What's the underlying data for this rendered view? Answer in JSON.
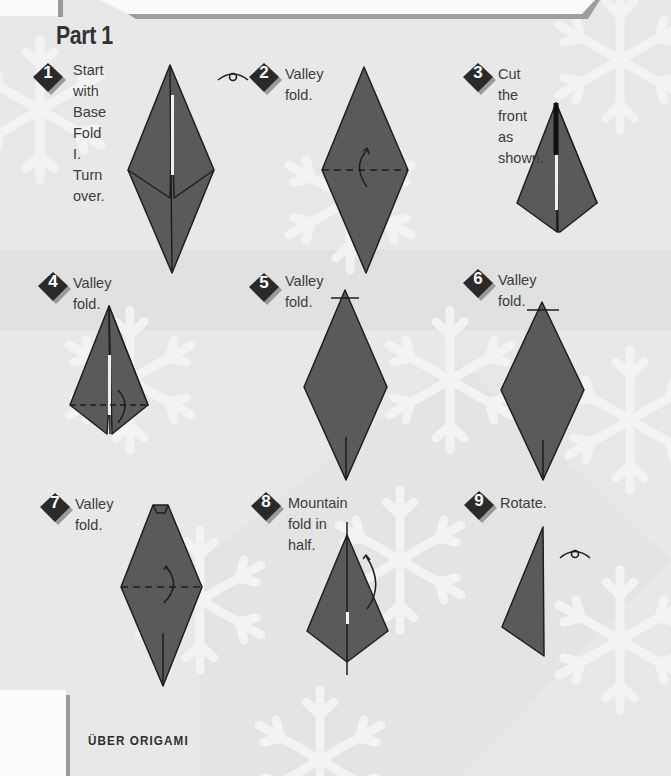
{
  "page": {
    "section_title": "Part 1",
    "footer_title": "ÜBER ORIGAMI"
  },
  "colors": {
    "paper": "#5a5a5a",
    "outline": "#1e1e1e",
    "badge": "#2a2a2a",
    "badge_shadow": "#9a9a9a",
    "background": "#e6e6e6"
  },
  "steps": [
    {
      "number": "1",
      "text": "Start with\nBase Fold I.\nTurn over.",
      "icon": "turn-over-eye-icon"
    },
    {
      "number": "2",
      "text": "Valley fold.",
      "icon": "valley-fold-arrow-icon"
    },
    {
      "number": "3",
      "text": "Cut the front as shown.",
      "icon": "scissors-cut-line-icon"
    },
    {
      "number": "4",
      "text": "Valley fold.",
      "icon": "valley-fold-arrow-icon"
    },
    {
      "number": "5",
      "text": "Valley\nfold.",
      "icon": "fold-line-icon"
    },
    {
      "number": "6",
      "text": "Valley fold.",
      "icon": "fold-line-icon"
    },
    {
      "number": "7",
      "text": "Valley fold.",
      "icon": "valley-fold-arrow-icon"
    },
    {
      "number": "8",
      "text": "Mountain fold in half.",
      "icon": "mountain-fold-arrow-icon"
    },
    {
      "number": "9",
      "text": "Rotate.",
      "icon": "rotate-eye-icon"
    }
  ]
}
